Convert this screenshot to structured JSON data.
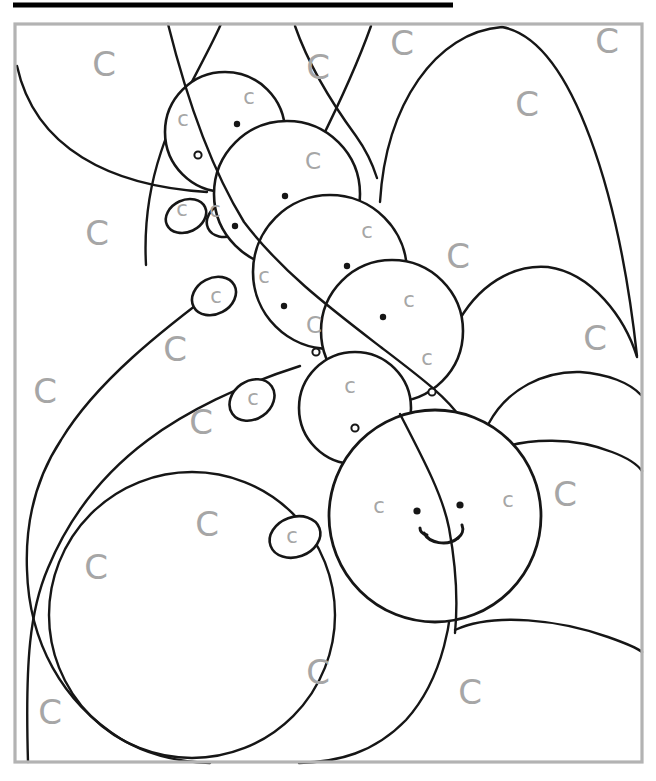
{
  "artwork": {
    "description": "Hidden-picture coloring page: a caterpillar built from overlapping outlined circles; regions marked with letter C",
    "canvas": {
      "w": 656,
      "h": 781
    },
    "palette": {
      "line": "#161616",
      "letter_gray": "#a6a6a6",
      "frame_gray": "#b3b3b3",
      "fill_white": "#ffffff",
      "background": "#ffffff"
    },
    "frame": {
      "x": 15,
      "y": 24,
      "w": 627,
      "h": 738,
      "stroke_w": 3.2
    },
    "top_bar": {
      "x1": 13,
      "y": 5,
      "x2": 453,
      "stroke_w": 5
    },
    "letters": {
      "big": {
        "glyph": "C",
        "font_size": 34,
        "items": [
          [
            104,
            64
          ],
          [
            318,
            67
          ],
          [
            402,
            43
          ],
          [
            607,
            41
          ],
          [
            527,
            104
          ],
          [
            97,
            233
          ],
          [
            175,
            349
          ],
          [
            45,
            391
          ],
          [
            201,
            422
          ],
          [
            458,
            256
          ],
          [
            595,
            338
          ],
          [
            565,
            494
          ],
          [
            207,
            524
          ],
          [
            96,
            567
          ],
          [
            50,
            712
          ],
          [
            318,
            672
          ],
          [
            470,
            692
          ]
        ]
      },
      "medium": {
        "glyph": "C",
        "font_size": 23,
        "items": [
          [
            313,
            161
          ],
          [
            314,
            325
          ]
        ]
      },
      "small": {
        "glyph": "c",
        "font_size": 21,
        "items": [
          [
            249,
            97
          ],
          [
            183,
            119
          ],
          [
            182,
            209
          ],
          [
            215,
            210
          ],
          [
            367,
            231
          ],
          [
            264,
            276
          ],
          [
            216,
            296
          ],
          [
            409,
            300
          ],
          [
            427,
            358
          ],
          [
            350,
            386
          ],
          [
            253,
            398
          ],
          [
            379,
            506
          ],
          [
            508,
            500
          ],
          [
            292,
            536
          ]
        ]
      }
    },
    "dots": {
      "solid": [
        [
          237,
          124
        ],
        [
          285,
          196
        ],
        [
          235,
          226
        ],
        [
          284,
          306
        ],
        [
          383,
          317
        ],
        [
          347,
          266
        ]
      ],
      "ring": [
        [
          198,
          155
        ],
        [
          316,
          352
        ],
        [
          355,
          428
        ],
        [
          432,
          392
        ]
      ]
    },
    "face": {
      "eyes": [
        [
          417,
          511
        ],
        [
          460,
          505
        ]
      ],
      "smile": [
        "M424,533 C429,543 447,547 458,538",
        "M420,528 C420,532 423,534 427,535",
        "M458,538 C462,535 464,530 462,525"
      ]
    },
    "shapes": {
      "background_arcs": [
        "M17,66 C35,148 110,186 207,192",
        "M221,24 C204,62 175,108 161,152 C149,188 144,228 146,265",
        "M295,26 C309,66 331,102 356,136 C366,150 372,162 377,178",
        "M371,26 C356,68 336,110 319,144 C313,156 307,166 301,172",
        "M380,202 C386,104 436,32 502,27 C574,40 620,200 637,356",
        "M455,328 C477,284 514,264 548,267 C592,273 625,318 637,357",
        "M489,423 C508,388 545,371 580,372 C608,374 630,383 641,395",
        "M490,452 C528,436 577,438 612,452 C628,458 637,464 642,471",
        "M455,630 C494,612 560,620 608,637 C625,643 636,647 642,652",
        "M452,556 C456,618 442,680 406,720 C374,753 338,762 299,763",
        "M224,284 C162,330 96,382 61,440 C36,478 25,520 27,570 C29,642 62,702 121,739 C151,757 181,762 210,763",
        "M300,366 C240,385 185,412 148,440 C105,472 70,515 48,568 C30,610 25,660 28,762"
      ],
      "background_circles": [
        {
          "cx": 192,
          "cy": 615,
          "r": 143
        }
      ],
      "segments": [
        [
          225,
          132,
          60
        ],
        [
          287,
          194,
          73
        ],
        [
          330,
          272,
          77
        ],
        [
          392,
          331,
          71
        ],
        [
          355,
          408,
          56
        ]
      ],
      "petals": [
        [
          186,
          216,
          21,
          16,
          -25
        ],
        [
          228,
          219,
          22,
          17,
          -25
        ],
        [
          214,
          296,
          23,
          18,
          -28
        ],
        [
          252,
          400,
          24,
          19,
          -35
        ],
        [
          295,
          537,
          26,
          20,
          -20
        ]
      ],
      "head": {
        "cx": 435,
        "cy": 516,
        "r": 106
      },
      "overlay_arcs": [
        "M168,24 C186,96 212,170 244,222 C282,272 330,308 382,348 C420,377 448,398 462,420",
        "M400,414 C426,464 443,497 449,528 C456,566 458,602 455,633"
      ]
    }
  }
}
